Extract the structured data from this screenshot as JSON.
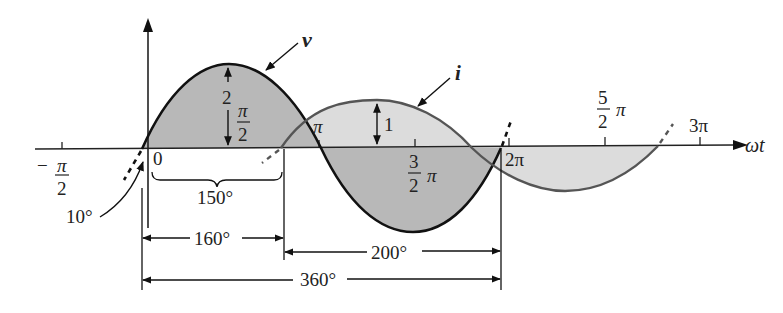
{
  "diagram": {
    "axis": {
      "x_label": "ωt",
      "ticks": [
        {
          "id": "neg_pi_over_2",
          "num": "π",
          "den": "2",
          "sign": "−"
        },
        {
          "id": "zero",
          "text": "0"
        },
        {
          "id": "pi",
          "text": "π"
        },
        {
          "id": "three_pi_over_2",
          "num": "3",
          "den": "2",
          "suffix": "π"
        },
        {
          "id": "two_pi",
          "text": "2π"
        },
        {
          "id": "five_pi_over_2",
          "num": "5",
          "den": "2",
          "suffix": "π"
        },
        {
          "id": "three_pi",
          "text": "3π"
        }
      ]
    },
    "curves": {
      "v": {
        "label": "v",
        "peak_marker": "2",
        "peak_frac_num": "π",
        "peak_frac_den": "2",
        "stroke": "#111111",
        "fill": "#b8b8b8"
      },
      "i": {
        "label": "i",
        "peak_marker": "1",
        "stroke": "#555555",
        "fill": "#dcdcdc"
      }
    },
    "angles": {
      "lead_angle": "10°",
      "brace_angle": "150°",
      "dim_160": "160°",
      "dim_200": "200°",
      "dim_360": "360°"
    },
    "colors": {
      "ink": "#111111",
      "v_fill": "#b8b8b8",
      "i_fill": "#dcdcdc",
      "i_stroke": "#555555"
    }
  }
}
